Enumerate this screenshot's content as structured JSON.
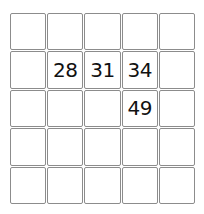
{
  "puzzle": {
    "type": "number-grid",
    "rows": 5,
    "columns": 5,
    "grid_line_color": "#8c8c8c",
    "cell_background": "#ffffff",
    "digit_color": "#111111",
    "cells": [
      [
        {
          "value": ""
        },
        {
          "value": ""
        },
        {
          "value": ""
        },
        {
          "value": ""
        },
        {
          "value": ""
        }
      ],
      [
        {
          "value": ""
        },
        {
          "value": "28"
        },
        {
          "value": "31"
        },
        {
          "value": "34"
        },
        {
          "value": ""
        }
      ],
      [
        {
          "value": ""
        },
        {
          "value": ""
        },
        {
          "value": ""
        },
        {
          "value": "49"
        },
        {
          "value": ""
        }
      ],
      [
        {
          "value": ""
        },
        {
          "value": ""
        },
        {
          "value": ""
        },
        {
          "value": ""
        },
        {
          "value": ""
        }
      ],
      [
        {
          "value": ""
        },
        {
          "value": ""
        },
        {
          "value": ""
        },
        {
          "value": ""
        },
        {
          "value": ""
        }
      ]
    ]
  }
}
